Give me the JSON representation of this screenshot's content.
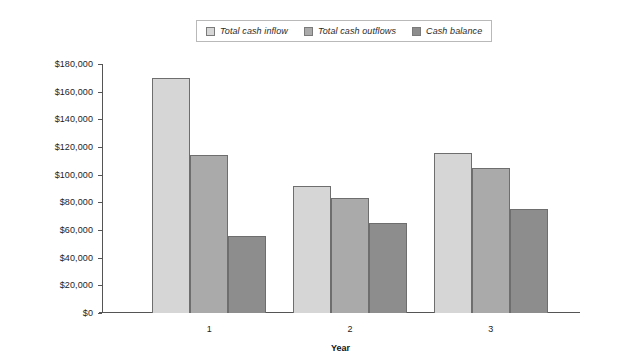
{
  "legend": {
    "position": "top-center",
    "entries": [
      {
        "label": "Total cash inflow",
        "color": "#d6d6d6",
        "swatch_icon": "square-swatch-icon"
      },
      {
        "label": "Total cash outflows",
        "color": "#aaaaaa",
        "swatch_icon": "square-swatch-icon"
      },
      {
        "label": "Cash balance",
        "color": "#8d8d8d",
        "swatch_icon": "square-swatch-icon"
      }
    ]
  },
  "axis": {
    "y_ticks": [
      "$180,000",
      "$160,000",
      "$140,000",
      "$120,000",
      "$100,000",
      "$80,000",
      "$60,000",
      "$40,000",
      "$20,000",
      "$0"
    ],
    "x_title": "Year",
    "x_ticks": [
      "1",
      "2",
      "3"
    ]
  },
  "chart_data": {
    "type": "bar",
    "title": "",
    "subtitle": "",
    "xlabel": "Year",
    "ylabel": "",
    "categories": [
      "1",
      "2",
      "3"
    ],
    "series": [
      {
        "name": "Total cash inflow",
        "color": "#d6d6d6",
        "values": [
          170000,
          92000,
          116000
        ]
      },
      {
        "name": "Total cash outflows",
        "color": "#aaaaaa",
        "values": [
          114000,
          83000,
          105000
        ]
      },
      {
        "name": "Cash balance",
        "color": "#8d8d8d",
        "values": [
          56000,
          65000,
          75000
        ]
      }
    ],
    "ylim": [
      0,
      180000
    ],
    "ytick_step": 20000,
    "ytick_labels": [
      "$0",
      "$20,000",
      "$40,000",
      "$60,000",
      "$80,000",
      "$100,000",
      "$120,000",
      "$140,000",
      "$160,000",
      "$180,000"
    ],
    "grid": false,
    "legend_position": "top-center",
    "value_prefix": "$"
  }
}
